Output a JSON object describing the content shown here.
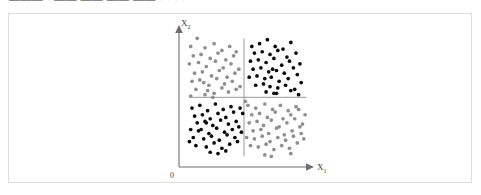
{
  "header": {
    "clipped_text": "———  · ——  ——  ——  ——  · · · ·"
  },
  "figure": {
    "origin_label": "0",
    "x_axis_label": "X",
    "x_axis_subscript": "1",
    "y_axis_label": "X",
    "y_axis_subscript": "2"
  },
  "colors": {
    "class_a": "#0d0d0d",
    "class_b": "#8f8f8f",
    "axis": "#6e6e6e",
    "divider": "#9a9a9a",
    "card_border": "#dcdcdc",
    "background": "#ffffff"
  },
  "chart_data": {
    "type": "scatter",
    "title": "",
    "xlabel": "X1",
    "ylabel": "X2",
    "xlim": [
      0,
      100
    ],
    "ylim": [
      0,
      100
    ],
    "grid": false,
    "legend_position": "none",
    "annotations": [
      {
        "type": "vline",
        "x": 50,
        "y0": 8,
        "y1": 96,
        "color": "#9a9a9a"
      },
      {
        "type": "hline",
        "y": 52,
        "x0": 8,
        "x1": 98,
        "color": "#9a9a9a"
      }
    ],
    "series": [
      {
        "name": "class_a",
        "color": "#0d0d0d",
        "marker": "circle",
        "quadrants": [
          "upper-right",
          "lower-left"
        ],
        "points": [
          [
            56,
            90
          ],
          [
            62,
            92
          ],
          [
            68,
            95
          ],
          [
            74,
            90
          ],
          [
            80,
            88
          ],
          [
            86,
            93
          ],
          [
            58,
            85
          ],
          [
            64,
            86
          ],
          [
            70,
            84
          ],
          [
            76,
            87
          ],
          [
            83,
            82
          ],
          [
            90,
            85
          ],
          [
            55,
            79
          ],
          [
            61,
            80
          ],
          [
            67,
            78
          ],
          [
            73,
            81
          ],
          [
            79,
            76
          ],
          [
            85,
            79
          ],
          [
            57,
            73
          ],
          [
            63,
            74
          ],
          [
            69,
            71
          ],
          [
            72,
            73
          ],
          [
            75,
            72
          ],
          [
            81,
            70
          ],
          [
            88,
            74
          ],
          [
            93,
            77
          ],
          [
            54,
            67
          ],
          [
            60,
            68
          ],
          [
            66,
            66
          ],
          [
            71,
            67
          ],
          [
            77,
            64
          ],
          [
            84,
            66
          ],
          [
            91,
            69
          ],
          [
            59,
            61
          ],
          [
            65,
            62
          ],
          [
            70,
            60
          ],
          [
            76,
            59
          ],
          [
            82,
            61
          ],
          [
            89,
            58
          ],
          [
            94,
            63
          ],
          [
            67,
            56
          ],
          [
            73,
            55
          ],
          [
            75,
            55
          ],
          [
            86,
            57
          ],
          [
            92,
            54
          ],
          [
            10,
            44
          ],
          [
            16,
            46
          ],
          [
            22,
            42
          ],
          [
            28,
            47
          ],
          [
            34,
            43
          ],
          [
            40,
            45
          ],
          [
            12,
            38
          ],
          [
            18,
            39
          ],
          [
            24,
            36
          ],
          [
            30,
            40
          ],
          [
            36,
            37
          ],
          [
            42,
            41
          ],
          [
            14,
            33
          ],
          [
            20,
            34
          ],
          [
            21,
            33
          ],
          [
            26,
            31
          ],
          [
            32,
            35
          ],
          [
            38,
            32
          ],
          [
            44,
            34
          ],
          [
            9,
            28
          ],
          [
            15,
            27
          ],
          [
            17,
            28
          ],
          [
            23,
            25
          ],
          [
            29,
            29
          ],
          [
            35,
            26
          ],
          [
            41,
            28
          ],
          [
            46,
            30
          ],
          [
            11,
            22
          ],
          [
            19,
            21
          ],
          [
            25,
            23
          ],
          [
            31,
            20
          ],
          [
            37,
            24
          ],
          [
            43,
            22
          ],
          [
            48,
            26
          ],
          [
            13,
            16
          ],
          [
            21,
            15
          ],
          [
            27,
            18
          ],
          [
            33,
            14
          ],
          [
            39,
            17
          ],
          [
            45,
            19
          ],
          [
            8,
            19
          ],
          [
            24,
            11
          ],
          [
            30,
            10
          ],
          [
            36,
            12
          ],
          [
            47,
            44
          ],
          [
            49,
            40
          ]
        ]
      },
      {
        "name": "class_b",
        "color": "#8f8f8f",
        "marker": "circle",
        "quadrants": [
          "upper-left",
          "lower-right"
        ],
        "points": [
          [
            14,
            96
          ],
          [
            9,
            90
          ],
          [
            20,
            89
          ],
          [
            27,
            92
          ],
          [
            33,
            87
          ],
          [
            39,
            90
          ],
          [
            44,
            86
          ],
          [
            11,
            83
          ],
          [
            17,
            84
          ],
          [
            24,
            81
          ],
          [
            30,
            85
          ],
          [
            36,
            80
          ],
          [
            42,
            83
          ],
          [
            8,
            77
          ],
          [
            15,
            78
          ],
          [
            21,
            75
          ],
          [
            28,
            79
          ],
          [
            34,
            74
          ],
          [
            40,
            77
          ],
          [
            46,
            73
          ],
          [
            12,
            70
          ],
          [
            18,
            71
          ],
          [
            25,
            68
          ],
          [
            31,
            72
          ],
          [
            37,
            67
          ],
          [
            43,
            70
          ],
          [
            10,
            64
          ],
          [
            16,
            65
          ],
          [
            19,
            63
          ],
          [
            23,
            61
          ],
          [
            29,
            66
          ],
          [
            35,
            62
          ],
          [
            41,
            64
          ],
          [
            47,
            60
          ],
          [
            13,
            58
          ],
          [
            22,
            57
          ],
          [
            27,
            55
          ],
          [
            33,
            59
          ],
          [
            38,
            56
          ],
          [
            44,
            58
          ],
          [
            9,
            53
          ],
          [
            26,
            52
          ],
          [
            20,
            54
          ],
          [
            53,
            46
          ],
          [
            59,
            44
          ],
          [
            66,
            47
          ],
          [
            72,
            43
          ],
          [
            78,
            46
          ],
          [
            84,
            42
          ],
          [
            90,
            45
          ],
          [
            56,
            39
          ],
          [
            62,
            40
          ],
          [
            68,
            37
          ],
          [
            74,
            41
          ],
          [
            80,
            36
          ],
          [
            86,
            39
          ],
          [
            92,
            43
          ],
          [
            54,
            33
          ],
          [
            60,
            34
          ],
          [
            65,
            31
          ],
          [
            71,
            35
          ],
          [
            77,
            30
          ],
          [
            83,
            33
          ],
          [
            89,
            36
          ],
          [
            95,
            32
          ],
          [
            57,
            27
          ],
          [
            63,
            28
          ],
          [
            69,
            25
          ],
          [
            75,
            29
          ],
          [
            81,
            24
          ],
          [
            87,
            27
          ],
          [
            93,
            30
          ],
          [
            52,
            22
          ],
          [
            58,
            21
          ],
          [
            64,
            23
          ],
          [
            70,
            19
          ],
          [
            76,
            22
          ],
          [
            82,
            20
          ],
          [
            88,
            23
          ],
          [
            94,
            25
          ],
          [
            55,
            16
          ],
          [
            61,
            15
          ],
          [
            67,
            17
          ],
          [
            73,
            13
          ],
          [
            79,
            16
          ],
          [
            85,
            14
          ],
          [
            91,
            18
          ],
          [
            96,
            21
          ],
          [
            66,
            9
          ],
          [
            71,
            8
          ],
          [
            86,
            10
          ],
          [
            51,
            49
          ],
          [
            97,
            39
          ]
        ]
      }
    ]
  }
}
